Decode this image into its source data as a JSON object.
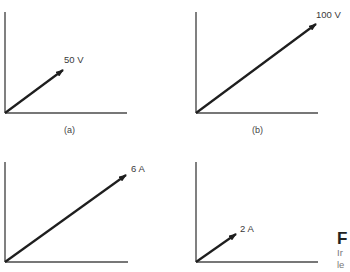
{
  "panels": [
    {
      "id": "a",
      "caption": "(a)",
      "vector_label": "50 V",
      "quantity": "voltage",
      "magnitude": 50,
      "unit": "V"
    },
    {
      "id": "b",
      "caption": "(b)",
      "vector_label": "100 V",
      "quantity": "voltage",
      "magnitude": 100,
      "unit": "V"
    },
    {
      "id": "c",
      "caption": "",
      "vector_label": "6 A",
      "quantity": "current",
      "magnitude": 6,
      "unit": "A"
    },
    {
      "id": "d",
      "caption": "",
      "vector_label": "2 A",
      "quantity": "current",
      "magnitude": 2,
      "unit": "A"
    }
  ],
  "side_text": {
    "title_fragment": "F",
    "line1_fragment": "Ir",
    "line2_fragment": "le"
  },
  "colors": {
    "axis": "#4a4a4a",
    "vector": "#1e1e1e",
    "label": "#3a3a3a"
  }
}
